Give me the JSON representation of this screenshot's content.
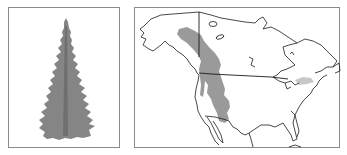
{
  "figure": {
    "panels": [
      {
        "id": "tree",
        "description": "Silhouette of a tall narrow conifer tree"
      },
      {
        "id": "range-map",
        "description": "Outline map of North America showing species range"
      }
    ],
    "colors": {
      "background": "#ffffff",
      "frame": "#8a8a8a",
      "tree_fill": "#858585",
      "range_primary": "#9a9a9a",
      "range_secondary": "#c8c8c8",
      "coastline": "#1a1a1a"
    },
    "map": {
      "region": "North America",
      "ranges": [
        {
          "name": "western-range",
          "area": "Alaska/Yukon south through the Rocky Mountains to Arizona/New Mexico",
          "shade": "primary"
        },
        {
          "name": "eastern-disjunct",
          "area": "Southern Ontario / Great Lakes region",
          "shade": "secondary"
        }
      ],
      "borders": [
        "US-Canada border (49th parallel)",
        "US-Mexico border"
      ]
    }
  }
}
